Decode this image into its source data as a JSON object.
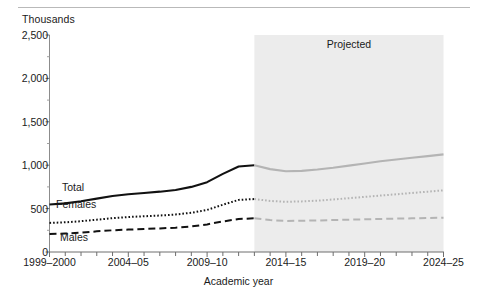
{
  "figure": {
    "y_axis_unit": "Thousands",
    "x_axis_title": "Academic year",
    "projected_label": "Projected"
  },
  "series_labels": {
    "total": "Total",
    "females": "Females",
    "males": "Males"
  },
  "chart_data": {
    "type": "line",
    "title": "",
    "subtitle": "",
    "xlabel": "Academic year",
    "ylabel": "Thousands",
    "ylim": [
      0,
      2500
    ],
    "yticks": [
      0,
      500,
      1000,
      1500,
      2000,
      2500
    ],
    "ytick_labels": [
      "0",
      "500",
      "1,000",
      "1,500",
      "2,000",
      "2,500"
    ],
    "grid": false,
    "legend": "inline-annotations",
    "annotations": [
      "Total",
      "Females",
      "Males",
      "Projected"
    ],
    "projection_start": "2012-13",
    "projection_shading": "#ececec",
    "x": [
      "1999-2000",
      "2000-01",
      "2001-02",
      "2002-03",
      "2003-04",
      "2004-05",
      "2005-06",
      "2006-07",
      "2007-08",
      "2008-09",
      "2009-10",
      "2010-11",
      "2011-12",
      "2012-13",
      "2013-14",
      "2014-15",
      "2015-16",
      "2016-17",
      "2017-18",
      "2018-19",
      "2019-20",
      "2020-21",
      "2021-22",
      "2022-23",
      "2023-24",
      "2024-25"
    ],
    "xtick_labels": [
      "1999–2000",
      "2004–05",
      "2009–10",
      "2014–15",
      "2019–20",
      "2024–25"
    ],
    "xtick_label_indices": [
      0,
      5,
      10,
      15,
      20,
      25
    ],
    "series": [
      {
        "name": "Total",
        "style": "solid",
        "values": [
          548,
          560,
          585,
          615,
          645,
          665,
          680,
          695,
          715,
          750,
          805,
          900,
          985,
          1000,
          955,
          930,
          935,
          950,
          970,
          995,
          1020,
          1045,
          1065,
          1085,
          1105,
          1125
        ]
      },
      {
        "name": "Females",
        "style": "dotted",
        "values": [
          335,
          342,
          355,
          372,
          390,
          403,
          412,
          420,
          432,
          452,
          485,
          545,
          600,
          610,
          588,
          578,
          583,
          592,
          605,
          620,
          635,
          650,
          665,
          680,
          695,
          710
        ]
      },
      {
        "name": "Males",
        "style": "dashed",
        "values": [
          208,
          213,
          222,
          238,
          250,
          258,
          265,
          272,
          280,
          295,
          318,
          352,
          380,
          388,
          368,
          358,
          360,
          363,
          368,
          372,
          377,
          381,
          385,
          388,
          392,
          396
        ]
      }
    ]
  }
}
